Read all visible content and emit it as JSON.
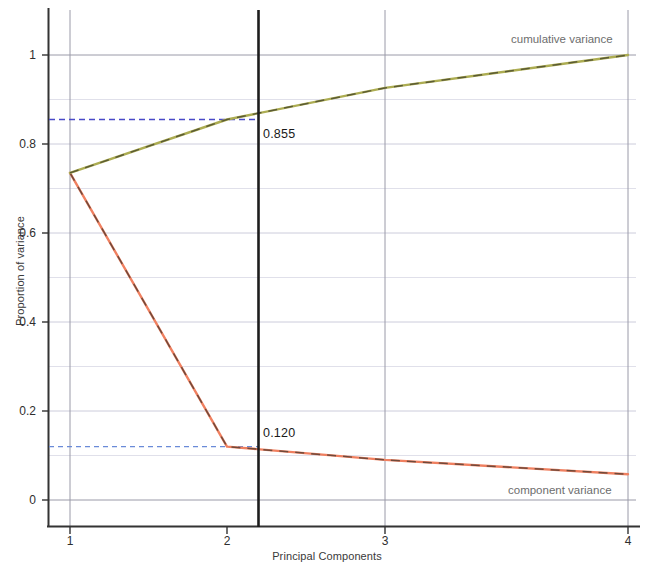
{
  "chart_data": {
    "type": "line",
    "title": "",
    "xlabel": "Principal Components",
    "ylabel": "Proportion of variance",
    "x": [
      1,
      2,
      3,
      4
    ],
    "xticklabels": [
      "1",
      "2",
      "3",
      "4"
    ],
    "yticklabels": [
      "0",
      "0.2",
      "0.4",
      "0.6",
      "0.8",
      "1"
    ],
    "ytickvalues": [
      0,
      0.2,
      0.4,
      0.6,
      0.8,
      1
    ],
    "xlim": [
      0.82,
      4.18
    ],
    "ylim": [
      -0.1,
      1.1
    ],
    "grid": true,
    "legend_position": "inline-right",
    "series": [
      {
        "name": "cumulative variance",
        "label": "cumulative variance",
        "color": "#a8a84a",
        "dash_color": "#3c3c28",
        "values": [
          0.735,
          0.855,
          0.926,
          1.0
        ]
      },
      {
        "name": "component variance",
        "label": "component variance",
        "color": "#f08060",
        "dash_color": "#3c3028",
        "values": [
          0.735,
          0.12,
          0.09,
          0.058
        ]
      }
    ],
    "annotations": [
      {
        "name": "cumulative-value-at-pc2",
        "text": "0.855",
        "x": 2,
        "y": 0.855,
        "guide_color": "#4a4ac8",
        "guide_style": "dashed"
      },
      {
        "name": "component-value-at-pc2",
        "text": "0.120",
        "x": 2,
        "y": 0.12,
        "guide_color": "#6a8ad8",
        "guide_style": "dashed"
      }
    ],
    "marker_line": {
      "name": "selected-component-marker",
      "x": 2,
      "color": "#1a1a1a"
    },
    "axis_color": "#3a3a3a",
    "grid_color": "#c9c9d4",
    "background": "#ffffff"
  },
  "ticks": {
    "y": [
      "1",
      "0.8",
      "0.6",
      "0.4",
      "0.2",
      "0"
    ],
    "x": [
      "1",
      "2",
      "3",
      "4"
    ]
  },
  "labels": {
    "xaxis_title": "Principal Components",
    "yaxis_title": "Proportion of variance",
    "cumulative_series": "cumulative variance",
    "component_series": "component variance",
    "cumulative_value": "0.855",
    "component_value": "0.120"
  }
}
